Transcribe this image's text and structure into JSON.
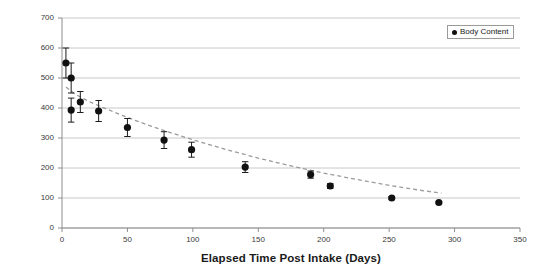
{
  "chart_data": {
    "type": "scatter",
    "title": "",
    "xlabel": "Elapsed Time Post Intake (Days)",
    "ylabel": "Body Content (nCi)",
    "xlim": [
      0,
      350
    ],
    "ylim": [
      0,
      700
    ],
    "xticks": [
      0,
      50,
      100,
      150,
      200,
      250,
      300,
      350
    ],
    "yticks": [
      0,
      100,
      200,
      300,
      400,
      500,
      600,
      700
    ],
    "grid": "horizontal",
    "legend_position": "top-right",
    "legend": [
      "Body Content"
    ],
    "marker_color": "#111111",
    "trendline_color": "#9b9b9b",
    "trendline_style": "dashed",
    "gridline_color": "#c8c8c8",
    "series": [
      {
        "name": "Body Content",
        "x": [
          3,
          7,
          7,
          14,
          28,
          50,
          78,
          99,
          140,
          190,
          205,
          252,
          288
        ],
        "values": [
          550,
          500,
          393,
          420,
          390,
          335,
          293,
          261,
          203,
          178,
          140,
          100,
          85
        ],
        "error": [
          50,
          50,
          40,
          35,
          35,
          30,
          28,
          25,
          18,
          12,
          8,
          5,
          3
        ]
      }
    ],
    "trendline": {
      "name": "Exponential decay fit",
      "x": [
        3,
        10,
        20,
        30,
        45,
        60,
        80,
        100,
        125,
        150,
        175,
        200,
        225,
        250,
        275,
        290
      ],
      "y": [
        470,
        446,
        423,
        404,
        377,
        352,
        322,
        294,
        262,
        233,
        207,
        183,
        162,
        142,
        125,
        116
      ]
    }
  },
  "legend": {
    "label": "Body Content",
    "marker": "filled-circle"
  },
  "axes": {
    "x_title": "Elapsed Time Post Intake (Days)",
    "y_title": "Body Content (nCi)",
    "x_tick_labels": [
      "0",
      "50",
      "100",
      "150",
      "200",
      "250",
      "300",
      "350"
    ],
    "y_tick_labels": [
      "0",
      "100",
      "200",
      "300",
      "400",
      "500",
      "600",
      "700"
    ]
  }
}
